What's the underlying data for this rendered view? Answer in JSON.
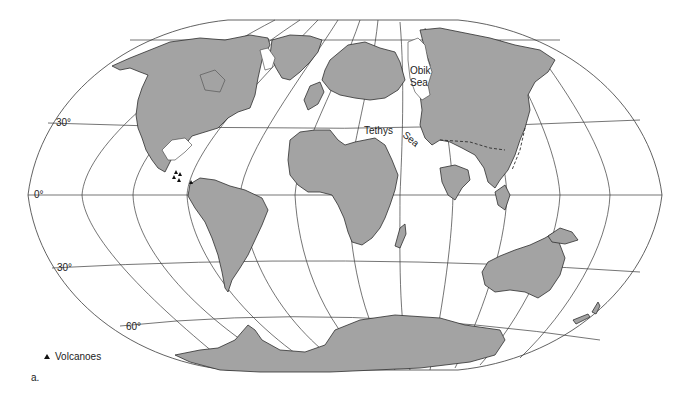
{
  "figure": {
    "panel_label": "a.",
    "land_color": "#a3a3a3",
    "ocean_color": "#ffffff",
    "line_color": "#3a3a3a"
  },
  "latitude_labels": {
    "lat_30n": "30°",
    "lat_0": "0°",
    "lat_30s": "30°",
    "lat_60s": "60°"
  },
  "sea_labels": {
    "obik_line1": "Obik",
    "obik_line2": "Sea",
    "tethys_word1": "Tethys",
    "tethys_word2": "Sea"
  },
  "legend": {
    "items": [
      {
        "icon": "triangle-icon",
        "label": "Volcanoes"
      }
    ]
  }
}
